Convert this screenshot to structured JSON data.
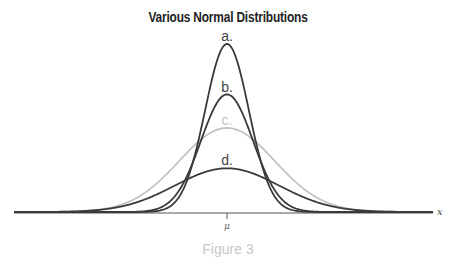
{
  "chart_data": {
    "type": "line",
    "title": "Various Normal Distributions",
    "xlabel": "x",
    "ylabel": "",
    "x_tick_labels": [
      "μ"
    ],
    "grid": false,
    "legend": "inline labels above peaks",
    "series": [
      {
        "name": "a.",
        "mean": 0,
        "relative_sd": 0.42,
        "relative_peak": 1.0,
        "color": "#3a3a3a"
      },
      {
        "name": "b.",
        "mean": 0,
        "relative_sd": 0.5,
        "relative_peak": 0.7,
        "color": "#3a3a3a"
      },
      {
        "name": "c.",
        "mean": 0,
        "relative_sd": 0.92,
        "relative_peak": 0.5,
        "color": "#c4c4c4"
      },
      {
        "name": "d.",
        "mean": 0,
        "relative_sd": 1.0,
        "relative_peak": 0.26,
        "color": "#3a3a3a"
      }
    ]
  },
  "caption": "Figure 3",
  "axis": {
    "x_label": "x",
    "tick_label": "μ"
  },
  "labels": {
    "a": "a.",
    "b": "b.",
    "c": "c.",
    "d": "d."
  }
}
